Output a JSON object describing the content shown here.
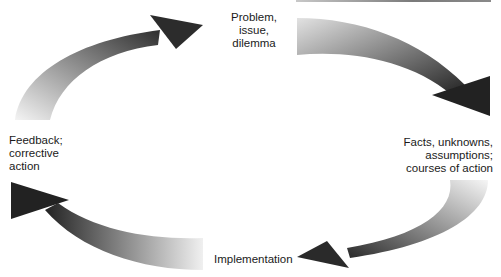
{
  "diagram": {
    "type": "cycle",
    "direction": "clockwise",
    "nodes": [
      {
        "id": "problem",
        "label": "Problem,\nissue,\ndilemma"
      },
      {
        "id": "facts",
        "label": "Facts, unknowns,\nassumptions;\ncourses of action"
      },
      {
        "id": "implementation",
        "label": "Implementation"
      },
      {
        "id": "feedback",
        "label": "Feedback;\ncorrective\naction"
      }
    ],
    "edges": [
      {
        "from": "feedback",
        "to": "problem"
      },
      {
        "from": "problem",
        "to": "facts"
      },
      {
        "from": "facts",
        "to": "implementation"
      },
      {
        "from": "implementation",
        "to": "feedback"
      }
    ],
    "colors": {
      "arrow_light": "#f2f2f2",
      "arrow_dark": "#2a2a2a",
      "text": "#1a1a1a",
      "background": "#ffffff"
    }
  }
}
